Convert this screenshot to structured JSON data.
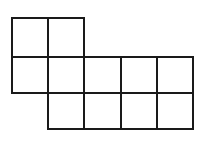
{
  "diagram": {
    "stroke_color": "#1a1a1a",
    "background": "#ffffff",
    "stroke_width": 2,
    "column_lines_x": [
      12,
      48,
      84,
      121,
      157,
      193
    ],
    "row_lines_y": [
      18,
      57,
      93,
      129
    ],
    "rows": [
      {
        "row": 1,
        "filled_columns": [
          1,
          2
        ]
      },
      {
        "row": 2,
        "filled_columns": [
          1,
          2,
          3,
          4,
          5
        ]
      },
      {
        "row": 3,
        "filled_columns": [
          2,
          3,
          4,
          5
        ]
      }
    ],
    "square_count": 11
  }
}
